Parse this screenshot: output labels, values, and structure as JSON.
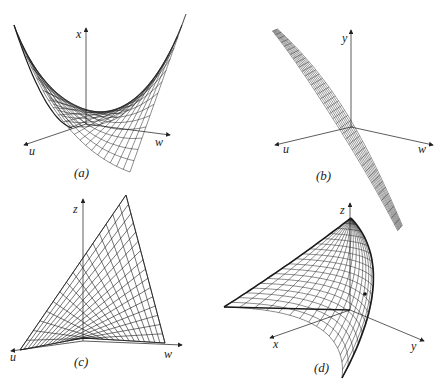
{
  "figure": {
    "panels": [
      {
        "id": "a",
        "caption": "(a)",
        "axes": {
          "vertical": "x",
          "left": "u",
          "right": "w"
        },
        "description": "Parabolic trough surface curving up steeply on both sides"
      },
      {
        "id": "b",
        "caption": "(b)",
        "axes": {
          "vertical": "y",
          "left": "u",
          "right": "w"
        },
        "description": "Twisted narrow sheet descending diagonally through origin"
      },
      {
        "id": "c",
        "caption": "(c)",
        "axes": {
          "vertical": "z",
          "left": "u",
          "right": "w"
        },
        "description": "Triangular ruled-surface mesh rising from the u-w plane"
      },
      {
        "id": "d",
        "caption": "(d)",
        "axes": {
          "vertical": "z",
          "left": "x",
          "right": "y"
        },
        "description": "Curved cusp-shaped surface patch with a marked point"
      }
    ],
    "colors": {
      "line": "#1a1a1a",
      "background": "#ffffff"
    }
  }
}
